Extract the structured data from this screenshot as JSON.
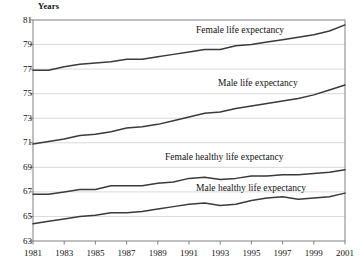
{
  "chart_data": {
    "type": "line",
    "title": "",
    "xlabel": "",
    "ylabel": "Years",
    "ylim": [
      63,
      81
    ],
    "xlim": [
      1981,
      2001
    ],
    "grid": true,
    "legend_position": "inline-annotations",
    "ytick_labels": [
      "81",
      "79",
      "77",
      "75",
      "73",
      "71",
      "69",
      "67",
      "65",
      "63"
    ],
    "yticks": [
      81,
      79,
      77,
      75,
      73,
      71,
      69,
      67,
      65,
      63
    ],
    "xtick_labels": [
      "1981",
      "1983",
      "1985",
      "1987",
      "1989",
      "1991",
      "1993",
      "1995",
      "1997",
      "1999",
      "2001"
    ],
    "xticks": [
      1981,
      1983,
      1985,
      1987,
      1989,
      1991,
      1993,
      1995,
      1997,
      1999,
      2001
    ],
    "x": [
      1981,
      1982,
      1983,
      1984,
      1985,
      1986,
      1987,
      1988,
      1989,
      1990,
      1991,
      1992,
      1993,
      1994,
      1995,
      1996,
      1997,
      1998,
      1999,
      2000,
      2001
    ],
    "series": [
      {
        "name": "Female life expectancy",
        "label": "Female life expectancy",
        "color": "#3a3a3a",
        "values": [
          76.9,
          76.9,
          77.2,
          77.4,
          77.5,
          77.6,
          77.8,
          77.8,
          78.0,
          78.2,
          78.4,
          78.6,
          78.6,
          78.9,
          79.0,
          79.2,
          79.4,
          79.6,
          79.8,
          80.1,
          80.6
        ]
      },
      {
        "name": "Male life expectancy",
        "label": "Male life expectancy",
        "color": "#3a3a3a",
        "values": [
          70.9,
          71.1,
          71.3,
          71.6,
          71.7,
          71.9,
          72.2,
          72.3,
          72.5,
          72.8,
          73.1,
          73.4,
          73.5,
          73.8,
          74.0,
          74.2,
          74.4,
          74.6,
          74.9,
          75.3,
          75.7
        ]
      },
      {
        "name": "Female healthy life expectancy",
        "label": "Female healthy life expectancy",
        "color": "#3a3a3a",
        "values": [
          66.8,
          66.8,
          67.0,
          67.2,
          67.2,
          67.5,
          67.5,
          67.5,
          67.7,
          67.8,
          68.1,
          68.2,
          68.0,
          68.1,
          68.3,
          68.3,
          68.4,
          68.4,
          68.5,
          68.6,
          68.8
        ]
      },
      {
        "name": "Male healthy life expectancy",
        "label": "Male healthy life expectancy",
        "color": "#3a3a3a",
        "values": [
          64.4,
          64.6,
          64.8,
          65.0,
          65.1,
          65.3,
          65.3,
          65.4,
          65.6,
          65.8,
          66.0,
          66.1,
          65.9,
          66.0,
          66.3,
          66.5,
          66.6,
          66.4,
          66.5,
          66.6,
          66.9
        ]
      }
    ]
  },
  "annotations": {
    "female_life": "Female life expectancy",
    "male_life": "Male life expectancy",
    "female_healthy": "Female healthy life expectancy",
    "male_healthy": "Male healthy life expectancy"
  },
  "colors": {
    "line": "#3a3a3a",
    "grid": "#d9d9d9",
    "frame": "#808080",
    "text": "#111111",
    "background": "#ffffff"
  }
}
